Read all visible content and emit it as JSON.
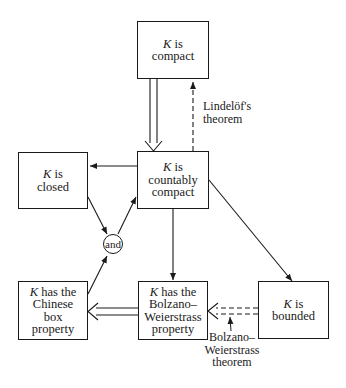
{
  "diagram": {
    "nodes": {
      "compact": {
        "var": "K",
        "text": " is",
        "line2": "compact",
        "line3": "",
        "line4": ""
      },
      "countably_compact": {
        "var": "K",
        "text": " is",
        "line2": "countably",
        "line3": "compact",
        "line4": ""
      },
      "closed": {
        "var": "K",
        "text": " is",
        "line2": "closed",
        "line3": "",
        "line4": ""
      },
      "chinese_box": {
        "var": "K",
        "text": " has the",
        "line2": "Chinese",
        "line3": "box",
        "line4": "property"
      },
      "bolzano_weierstrass": {
        "var": "K",
        "text": " has the",
        "line2": "Bolzano–",
        "line3": "Weierstrass",
        "line4": "property"
      },
      "bounded": {
        "var": "K",
        "text": " is",
        "line2": "bounded",
        "line3": "",
        "line4": ""
      },
      "and": {
        "text": "and"
      }
    },
    "labels": {
      "lindelof": {
        "line1": "Lindelöf's",
        "line2": "theorem"
      },
      "bw_theorem": {
        "line1": "Bolzano–",
        "line2": "Weierstrass",
        "line3": "theorem"
      }
    },
    "edges": [
      {
        "from": "compact",
        "to": "countably_compact",
        "style": "double-solid"
      },
      {
        "from": "countably_compact",
        "to": "compact",
        "style": "dashed",
        "label": "lindelof"
      },
      {
        "from": "countably_compact",
        "to": "closed",
        "style": "solid"
      },
      {
        "from": "closed",
        "to": "and",
        "style": "solid"
      },
      {
        "from": "chinese_box",
        "to": "and",
        "style": "solid"
      },
      {
        "from": "and",
        "to": "countably_compact",
        "style": "solid"
      },
      {
        "from": "countably_compact",
        "to": "bolzano_weierstrass",
        "style": "solid"
      },
      {
        "from": "countably_compact",
        "to": "bounded",
        "style": "solid"
      },
      {
        "from": "bolzano_weierstrass",
        "to": "chinese_box",
        "style": "double-solid"
      },
      {
        "from": "bounded",
        "to": "bolzano_weierstrass",
        "style": "double-dashed",
        "label": "bw_theorem"
      }
    ],
    "colors": {
      "ink": "#1a1a1a",
      "background": "#ffffff"
    }
  }
}
